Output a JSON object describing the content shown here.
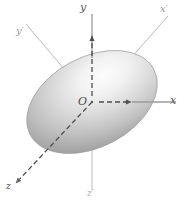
{
  "figure": {
    "kind": "ellipsoid-with-two-coordinate-frames",
    "background_color": "#ffffff",
    "canvas": {
      "width": 184,
      "height": 204
    }
  },
  "labels": {
    "origin": "O",
    "x": "x",
    "y": "y",
    "z": "z",
    "x_prime": "x′",
    "y_prime": "y′",
    "z_prime": "z′"
  },
  "axes": {
    "lab_frame": {
      "name": "xyz",
      "color": "#9b9b9b",
      "dashed_inner_color": "#4d4d4d",
      "items": [
        {
          "key": "x",
          "label": "x",
          "direction": "right",
          "style": "solid-outer-dashed-inner",
          "arrow": true
        },
        {
          "key": "y",
          "label": "y",
          "direction": "up",
          "style": "solid-outer-dashed-inner",
          "arrow": true
        },
        {
          "key": "z",
          "label": "z",
          "direction": "down-left",
          "style": "dashed",
          "arrow": true
        }
      ]
    },
    "principal_frame": {
      "name": "x′y′z′",
      "color": "#bdbdbd",
      "items": [
        {
          "key": "x_prime",
          "label": "x′",
          "direction": "up-right",
          "style": "solid",
          "arrow": false
        },
        {
          "key": "y_prime",
          "label": "y′",
          "direction": "up-left",
          "style": "solid",
          "arrow": false
        },
        {
          "key": "z_prime",
          "label": "z′",
          "direction": "down",
          "style": "solid",
          "arrow": false
        }
      ]
    }
  },
  "ellipsoid": {
    "center_x": 92,
    "center_y": 102,
    "semi_major": 70,
    "semi_minor": 45,
    "rotation_deg": -28,
    "highlight_color": "#fbfbfb",
    "mid_color": "#cfcfcf",
    "edge_color": "#8e8e8e",
    "outline_color": "#9a9a9a"
  },
  "colors": {
    "background": "#ffffff",
    "axis_gray": "#9b9b9b",
    "axis_light_gray": "#bdbdbd",
    "dash_dark": "#4d4d4d",
    "text_dark": "#4a4a4a",
    "text_light": "#a8a8a8"
  }
}
